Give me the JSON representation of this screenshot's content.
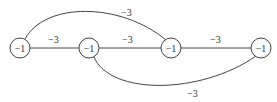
{
  "graph": {
    "nodes": [
      {
        "id": "n1",
        "label": "−1",
        "x": 20,
        "y": 48
      },
      {
        "id": "n2",
        "label": "−1",
        "x": 89,
        "y": 48
      },
      {
        "id": "n3",
        "label": "−1",
        "x": 171,
        "y": 48
      },
      {
        "id": "n4",
        "label": "−1",
        "x": 261,
        "y": 48
      }
    ],
    "edges": [
      {
        "from": "n1",
        "to": "n2",
        "label": "−3",
        "shape": "straight"
      },
      {
        "from": "n2",
        "to": "n3",
        "label": "−3",
        "shape": "straight"
      },
      {
        "from": "n3",
        "to": "n4",
        "label": "−3",
        "shape": "straight"
      },
      {
        "from": "n1",
        "to": "n3",
        "label": "−3",
        "shape": "arc-top"
      },
      {
        "from": "n2",
        "to": "n4",
        "label": "−3",
        "shape": "arc-bottom"
      }
    ]
  }
}
